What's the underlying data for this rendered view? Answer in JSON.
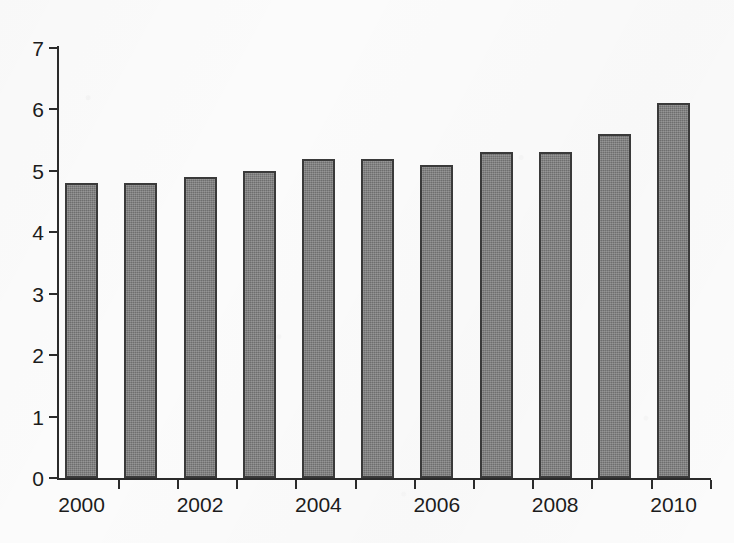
{
  "figure": {
    "background_color": "#fbfbfb",
    "ink_color": "#2b2b2b",
    "bar_fill_color": "#6e6e6e",
    "bar_border_color": "#3a3a3a"
  },
  "chart_data": {
    "type": "bar",
    "title": "",
    "subtitle": "",
    "xlabel": "",
    "ylabel": "",
    "categories": [
      "2000",
      "2001",
      "2002",
      "2003",
      "2004",
      "2005",
      "2006",
      "2007",
      "2008",
      "2009",
      "2010"
    ],
    "values": [
      4.8,
      4.8,
      4.9,
      5.0,
      5.2,
      5.2,
      5.1,
      5.3,
      5.3,
      5.6,
      6.1
    ],
    "ylim": [
      0,
      7
    ],
    "y_ticks": [
      0,
      1,
      2,
      3,
      4,
      5,
      6,
      7
    ],
    "y_tick_labels": [
      "0",
      "1",
      "2",
      "3",
      "4",
      "5",
      "6",
      "7"
    ],
    "x_tick_labels": [
      "2000",
      "",
      "2002",
      "",
      "2004",
      "",
      "2006",
      "",
      "2008",
      "",
      "2010"
    ],
    "x_visible_tick_labels": [
      "2000",
      "2002",
      "2004",
      "2006",
      "2008",
      "2010"
    ],
    "grid": false,
    "legend": null,
    "annotations": []
  }
}
